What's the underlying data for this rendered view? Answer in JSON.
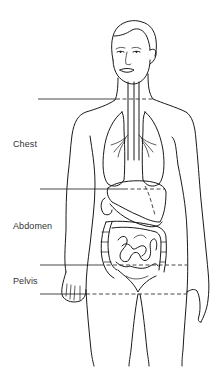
{
  "diagram": {
    "type": "anatomical-body-regions",
    "regions": [
      {
        "label": "Chest",
        "position": "between neck line and diaphragm line"
      },
      {
        "label": "Abdomen",
        "position": "between diaphragm line and upper pelvis line"
      },
      {
        "label": "Pelvis",
        "position": "between upper pelvis line and lower pelvis line"
      }
    ],
    "organs_depicted": [
      "lungs",
      "trachea",
      "bronchi",
      "esophagus",
      "liver",
      "stomach",
      "small intestine",
      "large intestine",
      "bladder"
    ],
    "boundary_lines": [
      {
        "name": "neck-boundary",
        "y": 99
      },
      {
        "name": "diaphragm-boundary",
        "y": 189
      },
      {
        "name": "upper-pelvis-boundary",
        "y": 265
      },
      {
        "name": "lower-pelvis-boundary",
        "y": 294
      }
    ],
    "colors": {
      "ink": "#1a1a1a",
      "label": "#333333",
      "background": "#ffffff"
    }
  }
}
